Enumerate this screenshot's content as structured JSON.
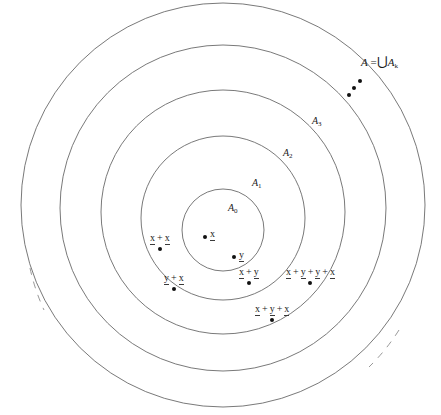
{
  "figure": {
    "type": "nested-sets-diagram",
    "background_color": "#ffffff",
    "stroke_color": "#6a6a6a",
    "dot_color": "#111111"
  },
  "set_labels": [
    {
      "name": "A",
      "subscript": "0",
      "x": 228,
      "y": 203
    },
    {
      "name": "A",
      "subscript": "1",
      "x": 252,
      "y": 178
    },
    {
      "name": "A",
      "subscript": "2",
      "x": 283,
      "y": 148
    },
    {
      "name": "A",
      "subscript": "3",
      "x": 312,
      "y": 116
    }
  ],
  "union_label": {
    "lead": "A",
    "equals": "=",
    "union_symbol": "⋃",
    "set": "A",
    "subscript": "k",
    "full_text": "A = ⋃Aₖ",
    "x": 361,
    "y": 55
  },
  "ellipsis_dots": [
    {
      "x": 347,
      "y": 93
    },
    {
      "x": 352,
      "y": 86
    },
    {
      "x": 358,
      "y": 79
    }
  ],
  "generators": [
    {
      "id": "gen-x",
      "text": "x",
      "underlined": true,
      "dot_x": 203,
      "dot_y": 235,
      "label_x": 210,
      "label_y": 228
    },
    {
      "id": "gen-y",
      "text": "y",
      "underlined": true,
      "dot_x": 232,
      "dot_y": 255,
      "label_x": 239,
      "label_y": 249
    }
  ],
  "terms": [
    {
      "id": "term-x-plus-x",
      "tokens": [
        "x",
        "+",
        "x"
      ],
      "expression": "x + x",
      "x": 150,
      "y": 232
    },
    {
      "id": "term-y-plus-x",
      "tokens": [
        "y",
        "+",
        "x"
      ],
      "expression": "y + x",
      "x": 164,
      "y": 272
    },
    {
      "id": "term-x-plus-y",
      "tokens": [
        "x",
        "+",
        "y"
      ],
      "expression": "x + y",
      "x": 239,
      "y": 266
    },
    {
      "id": "term-x-plus-y-plus-y-plus-x",
      "tokens": [
        "x",
        "+",
        "y",
        "+",
        "y",
        "+",
        "x"
      ],
      "expression": "x + y + y + x",
      "x": 286,
      "y": 266
    },
    {
      "id": "term-x-plus-y-plus-x",
      "tokens": [
        "x",
        "+",
        "y",
        "+",
        "x"
      ],
      "expression": "x + y + x",
      "x": 255,
      "y": 303
    }
  ],
  "circles": [
    {
      "id": "circle-A0",
      "cx": 223,
      "cy": 230,
      "r": 41,
      "dashed": false
    },
    {
      "id": "circle-A1",
      "cx": 223,
      "cy": 218,
      "r": 82,
      "dashed": false
    },
    {
      "id": "circle-A2",
      "cx": 223,
      "cy": 212,
      "r": 122,
      "dashed": false
    },
    {
      "id": "circle-A3",
      "cx": 223,
      "cy": 208,
      "r": 163,
      "dashed": false
    },
    {
      "id": "circle-A",
      "cx": 223,
      "cy": 205,
      "r": 202,
      "dashed": false
    }
  ],
  "truncation_arcs": [
    {
      "id": "arc-left-dashed",
      "note": "dashed arc fragment at lower-left indicating continuation"
    },
    {
      "id": "arc-right-dashed",
      "note": "dashed arc fragment at lower-right indicating continuation"
    }
  ]
}
